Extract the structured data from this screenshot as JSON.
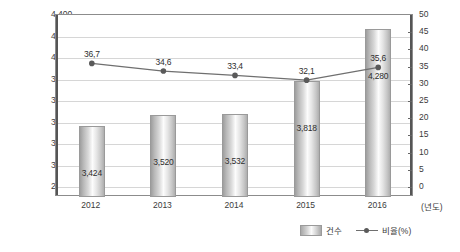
{
  "chart_data": {
    "type": "bar",
    "title": "",
    "subtitle": "",
    "xlabel": "(년도)",
    "ylabel": "",
    "categories": [
      "2012",
      "2013",
      "2014",
      "2015",
      "2016"
    ],
    "grid": true,
    "legend_position": "bottom-right",
    "series": [
      {
        "name": "건수",
        "type": "bar",
        "axis": "left",
        "values": [
          3424,
          3520,
          3532,
          3818,
          4280
        ],
        "labels": [
          "3,424",
          "3,520",
          "3,532",
          "3,818",
          "4,280"
        ]
      },
      {
        "name": "비율(%)",
        "type": "line",
        "axis": "right",
        "values": [
          36.7,
          34.6,
          33.4,
          32.1,
          35.6
        ],
        "labels": [
          "36,7",
          "34,6",
          "33,4",
          "32,1",
          "35,6"
        ]
      }
    ],
    "left_axis": {
      "ylim": [
        2800,
        4400
      ],
      "step": 200,
      "ticks": [
        "2,800",
        "3,000",
        "3,200",
        "3,400",
        "3,600",
        "3,800",
        "4,000",
        "4,200",
        "4,400"
      ]
    },
    "right_axis": {
      "ylim": [
        0,
        50
      ],
      "step": 5,
      "ticks": [
        "0",
        "5",
        "10",
        "15",
        "20",
        "25",
        "30",
        "35",
        "40",
        "45",
        "50"
      ]
    },
    "colors": {
      "bar_fill": "#d8d8d8",
      "bar_border": "#9a9a9a",
      "line": "#6f6f6f",
      "marker": "#5a5a5a",
      "grid": "#d6d6d6",
      "axis": "#555555",
      "text": "#3b3b3b"
    }
  },
  "legend": {
    "items": [
      {
        "label": "건수"
      },
      {
        "label": "비율(%)"
      }
    ]
  },
  "xaxis": {
    "title": "(년도)"
  }
}
